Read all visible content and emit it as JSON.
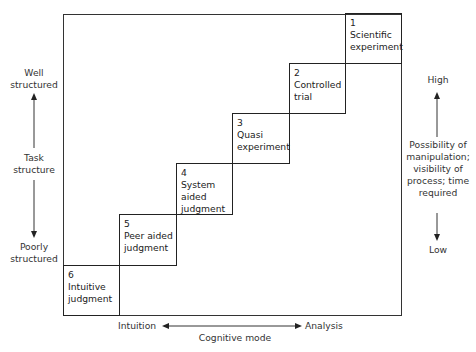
{
  "diagram": {
    "steps": [
      {
        "number": "1",
        "line1": "Scientific",
        "line2": "experiment"
      },
      {
        "number": "2",
        "line1": "Controlled",
        "line2": "trial"
      },
      {
        "number": "3",
        "line1": "Quasi",
        "line2": "experiment"
      },
      {
        "number": "4",
        "line1": "System",
        "line2": "aided",
        "line3": "judgment"
      },
      {
        "number": "5",
        "line1": "Peer aided",
        "line2": "judgment"
      },
      {
        "number": "6",
        "line1": "Intuitive",
        "line2": "judgment"
      }
    ],
    "left_axis": {
      "top_label_1": "Well",
      "top_label_2": "structured",
      "title_1": "Task",
      "title_2": "structure",
      "bottom_label_1": "Poorly",
      "bottom_label_2": "structured"
    },
    "right_axis": {
      "top_label": "High",
      "title_1": "Possibility of",
      "title_2": "manipulation;",
      "title_3": "visibility of",
      "title_4": "process; time",
      "title_5": "required",
      "bottom_label": "Low"
    },
    "bottom_axis": {
      "left_label": "Intuition",
      "right_label": "Analysis",
      "title": "Cognitive mode"
    }
  }
}
